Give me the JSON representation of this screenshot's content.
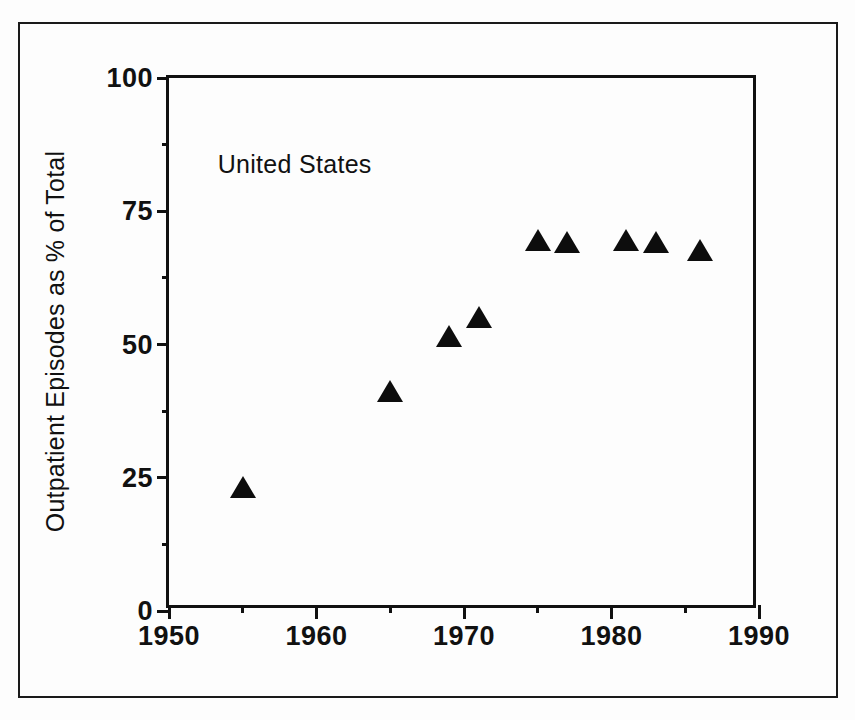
{
  "figure": {
    "background_color": "#fdfdfd",
    "ink_color": "#111111"
  },
  "chart_data": {
    "type": "scatter",
    "title": "",
    "xlabel": "",
    "ylabel": "Outpatient Episodes as % of Total",
    "annotation": "United States",
    "xlim": [
      1950,
      1990
    ],
    "ylim": [
      0,
      100
    ],
    "grid": false,
    "legend": null,
    "x_ticks": [
      1950,
      1960,
      1970,
      1980,
      1990
    ],
    "x_tick_labels": [
      "1950",
      "1960",
      "1970",
      "1980",
      "1990"
    ],
    "x_minor_ticks": [
      1955,
      1965,
      1975,
      1985
    ],
    "y_ticks": [
      0,
      25,
      50,
      75,
      100
    ],
    "y_tick_labels": [
      "0",
      "25",
      "50",
      "75",
      "100"
    ],
    "y_minor_ticks": [
      12.5,
      37.5,
      62.5,
      87.5
    ],
    "marker": "triangle-up",
    "marker_color": "#0d0d0d",
    "series": [
      {
        "name": "United States",
        "x": [
          1955,
          1965,
          1969,
          1971,
          1975,
          1977,
          1981,
          1983,
          1986
        ],
        "y": [
          23,
          41,
          51.5,
          55,
          69.5,
          69,
          69.5,
          69,
          67.5
        ]
      }
    ]
  }
}
